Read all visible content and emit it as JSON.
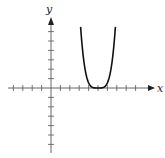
{
  "chart_data": {
    "type": "line",
    "title": "",
    "xlabel": "x",
    "ylabel": "y",
    "grid": false,
    "legend": null,
    "series": [
      {
        "name": "f(x)",
        "shape": "quartic",
        "vertex": [
          5,
          0
        ],
        "x": [
          3.1,
          3.5,
          4.0,
          4.5,
          5.0,
          5.5,
          6.0,
          6.5,
          6.8
        ],
        "y": [
          6.5,
          2.6,
          0.5,
          0.03,
          0,
          0.03,
          0.5,
          2.6,
          6.5
        ]
      }
    ],
    "x_ticks_count_left": 4,
    "x_ticks_count_right": 9,
    "y_ticks_count_up": 6,
    "y_ticks_count_down": 6,
    "xlim": [
      -4.5,
      10.5
    ],
    "ylim": [
      -6.8,
      7.3
    ]
  },
  "colors": {
    "curve": "#111111",
    "axis": "#555555",
    "background": "#ffffff"
  },
  "labels": {
    "x_axis": "x",
    "y_axis": "y"
  }
}
